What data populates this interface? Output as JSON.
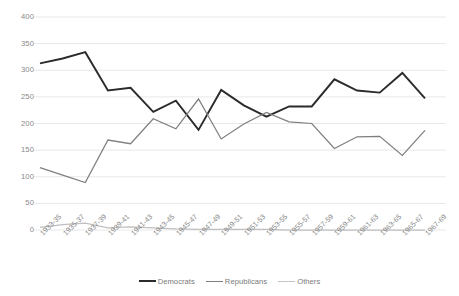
{
  "chart_data": {
    "type": "line",
    "title": "",
    "subtitle": "",
    "xlabel": "",
    "ylabel": "",
    "ylim": [
      0,
      400
    ],
    "yticks": [
      0,
      50,
      100,
      150,
      200,
      250,
      300,
      350,
      400
    ],
    "grid": true,
    "legend_position": "bottom",
    "categories": [
      "1933-35",
      "1935-37",
      "1937-39",
      "1939-41",
      "1941-43",
      "1943-45",
      "1945-47",
      "1947-49",
      "1949-51",
      "1951-53",
      "1953-55",
      "1955-57",
      "1957-59",
      "1959-61",
      "1961-63",
      "1963-65",
      "1965-67",
      "1967-69"
    ],
    "series": [
      {
        "name": "Democrats",
        "color": "#2b2b2b",
        "width": 1.9,
        "values": [
          313,
          322,
          334,
          262,
          267,
          222,
          243,
          188,
          263,
          234,
          213,
          232,
          232,
          283,
          262,
          258,
          295,
          247
        ]
      },
      {
        "name": "Republicans",
        "color": "#7f7f7f",
        "width": 1.25,
        "values": [
          117,
          103,
          89,
          169,
          162,
          209,
          190,
          246,
          171,
          199,
          221,
          203,
          200,
          153,
          175,
          176,
          140,
          187
        ]
      },
      {
        "name": "Others",
        "color": "#bfbfbf",
        "width": 1.25,
        "values": [
          5,
          10,
          13,
          4,
          6,
          4,
          2,
          1,
          1,
          1,
          1,
          0,
          0,
          0,
          0,
          0,
          0,
          0
        ]
      }
    ]
  },
  "axes": {
    "ytick_labels": [
      "400",
      "350",
      "300",
      "250",
      "200",
      "150",
      "100",
      "50",
      "0"
    ],
    "xtick_labels": [
      "1933-35",
      "1935-37",
      "1937-39",
      "1939-41",
      "1941-43",
      "1943-45",
      "1945-47",
      "1947-49",
      "1949-51",
      "1951-53",
      "1953-55",
      "1955-57",
      "1957-59",
      "1959-61",
      "1961-63",
      "1963-65",
      "1965-67",
      "1967-69"
    ]
  },
  "legend": {
    "items": [
      {
        "label": "Democrats",
        "color": "#2b2b2b",
        "thickness": "2.1px"
      },
      {
        "label": "Republicans",
        "color": "#7f7f7f",
        "thickness": "1.6px"
      },
      {
        "label": "Others",
        "color": "#c4c4c4",
        "thickness": "1.3px"
      }
    ]
  },
  "style": {
    "grid_color": "#e8e8e8",
    "background": "#ffffff",
    "tick_text_color": "#888888"
  }
}
